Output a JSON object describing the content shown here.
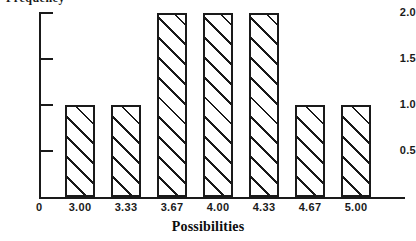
{
  "chart_data": {
    "type": "bar",
    "title": "",
    "subtitle": "",
    "xlabel": "Possibilities",
    "ylabel": "",
    "categories": [
      "3.00",
      "3.33",
      "3.67",
      "4.00",
      "4.33",
      "4.67",
      "5.00"
    ],
    "values": [
      1,
      1,
      2,
      2,
      2,
      1,
      1
    ],
    "series": [
      {
        "name": "Frequency",
        "values": [
          1,
          1,
          2,
          2,
          2,
          1,
          1
        ]
      }
    ],
    "ylim": [
      0,
      2.15
    ],
    "y_ticks": [
      "2.0",
      "1.5",
      "1.0",
      "0.5"
    ],
    "y_tick_values": [
      2.0,
      1.5,
      1.0,
      0.5
    ],
    "origin_label": "0",
    "x_tick_labels": [
      "3.00",
      "3.33",
      "3.67",
      "4.00",
      "4.33",
      "4.67",
      "5.00"
    ],
    "grid": false,
    "legend": false,
    "legend_position": "none",
    "bar_fill": "#ffffff",
    "bar_edge_color": "#1a1a1a",
    "bar_pattern": "diagonal-hatch",
    "axis_color": "#1a1a1a",
    "background": "#ffffff",
    "annotations": []
  },
  "axes": {
    "y_axis_caption": "Frequency",
    "x_axis_title": "Possibilities",
    "origin_label": "0"
  },
  "icons": {
    "y_tick_mark": "tick-mark",
    "x_tick_mark": "tick-mark"
  }
}
